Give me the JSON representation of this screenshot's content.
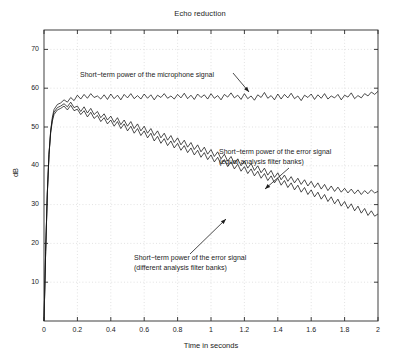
{
  "chart_data": {
    "type": "line",
    "title": "Echo reduction",
    "xlabel": "Time in seconds",
    "ylabel": "dB",
    "xlim": [
      0,
      2
    ],
    "ylim": [
      0,
      75
    ],
    "grid": true,
    "legend_position": "none",
    "xticks": [
      "0",
      "0.2",
      "0.4",
      "0.6",
      "0.8",
      "1",
      "1.2",
      "1.4",
      "1.6",
      "1.8",
      "2"
    ],
    "xtick_values": [
      0,
      0.2,
      0.4,
      0.6,
      0.8,
      1,
      1.2,
      1.4,
      1.6,
      1.8,
      2
    ],
    "yticks": [
      "10",
      "20",
      "30",
      "40",
      "50",
      "60",
      "70"
    ],
    "ytick_values": [
      10,
      20,
      30,
      40,
      50,
      60,
      70
    ],
    "x": [
      0.0,
      0.01,
      0.02,
      0.03,
      0.04,
      0.05,
      0.06,
      0.08,
      0.1,
      0.12,
      0.14,
      0.16,
      0.18,
      0.2,
      0.22,
      0.24,
      0.26,
      0.28,
      0.3,
      0.32,
      0.34,
      0.36,
      0.38,
      0.4,
      0.42,
      0.44,
      0.46,
      0.48,
      0.5,
      0.52,
      0.54,
      0.56,
      0.58,
      0.6,
      0.62,
      0.64,
      0.66,
      0.68,
      0.7,
      0.72,
      0.74,
      0.76,
      0.78,
      0.8,
      0.82,
      0.84,
      0.86,
      0.88,
      0.9,
      0.92,
      0.94,
      0.96,
      0.98,
      1.0,
      1.02,
      1.04,
      1.06,
      1.08,
      1.1,
      1.12,
      1.14,
      1.16,
      1.18,
      1.2,
      1.22,
      1.24,
      1.26,
      1.28,
      1.3,
      1.32,
      1.34,
      1.36,
      1.38,
      1.4,
      1.42,
      1.44,
      1.46,
      1.48,
      1.5,
      1.52,
      1.54,
      1.56,
      1.58,
      1.6,
      1.62,
      1.64,
      1.66,
      1.68,
      1.7,
      1.72,
      1.74,
      1.76,
      1.78,
      1.8,
      1.82,
      1.84,
      1.86,
      1.88,
      1.9,
      1.92,
      1.94,
      1.96,
      1.98,
      2.0
    ],
    "series": [
      {
        "name": "Short-term power of the microphone signal",
        "color": "#111111",
        "values": [
          0,
          18,
          33,
          43,
          49,
          52.5,
          54.5,
          55.8,
          56.2,
          57.0,
          56.4,
          57.6,
          56.8,
          58.2,
          57.2,
          58.4,
          57.4,
          58.6,
          57.6,
          58.0,
          57.2,
          58.3,
          57.1,
          58.5,
          57.3,
          58.2,
          57.0,
          58.4,
          57.5,
          58.6,
          57.3,
          58.1,
          57.2,
          58.5,
          57.4,
          58.3,
          57.0,
          58.2,
          57.6,
          58.6,
          57.4,
          58.0,
          57.2,
          58.4,
          57.5,
          58.7,
          57.3,
          58.2,
          57.1,
          58.5,
          57.6,
          58.3,
          57.2,
          58.6,
          57.4,
          58.1,
          57.0,
          58.4,
          57.7,
          58.8,
          57.5,
          58.2,
          57.1,
          58.6,
          57.3,
          58.0,
          56.9,
          58.3,
          57.6,
          58.9,
          57.4,
          58.1,
          57.0,
          58.5,
          57.2,
          58.4,
          57.5,
          58.7,
          57.3,
          58.0,
          56.8,
          58.2,
          57.6,
          58.5,
          57.1,
          58.3,
          57.4,
          58.6,
          57.2,
          58.0,
          57.5,
          58.4,
          57.0,
          58.2,
          57.7,
          58.8,
          57.3,
          58.1,
          57.5,
          58.6,
          58.0,
          59.0,
          58.4,
          59.2
        ]
      },
      {
        "name": "Short-term power of the error signal (equal analysis filter banks)",
        "color": "#111111",
        "values": [
          0,
          18,
          33,
          43,
          49,
          52.0,
          53.8,
          55.0,
          55.4,
          56.0,
          55.2,
          56.4,
          55.0,
          55.4,
          54.0,
          55.2,
          53.6,
          54.8,
          53.2,
          54.0,
          52.4,
          53.4,
          51.8,
          52.8,
          51.2,
          52.4,
          50.6,
          51.8,
          50.2,
          51.4,
          49.6,
          50.8,
          49.0,
          50.2,
          48.4,
          49.6,
          47.8,
          49.0,
          47.2,
          48.4,
          46.6,
          47.8,
          46.0,
          47.2,
          45.4,
          46.6,
          44.8,
          46.0,
          44.2,
          45.4,
          43.6,
          44.8,
          43.0,
          44.2,
          42.4,
          43.6,
          41.8,
          43.0,
          41.2,
          42.4,
          40.6,
          41.8,
          40.0,
          41.2,
          39.4,
          40.6,
          38.8,
          40.0,
          38.2,
          39.4,
          37.6,
          38.8,
          37.0,
          38.2,
          36.4,
          37.6,
          36.0,
          37.2,
          35.6,
          36.8,
          35.2,
          36.4,
          34.8,
          36.0,
          34.4,
          35.6,
          34.0,
          35.2,
          33.6,
          34.8,
          33.4,
          34.5,
          33.2,
          34.2,
          33.0,
          34.0,
          32.8,
          33.8,
          32.6,
          33.6,
          32.8,
          33.8,
          33.0,
          33.4
        ]
      },
      {
        "name": "Short-term power of the error signal (different analysis filter banks)",
        "color": "#111111",
        "values": [
          0,
          18,
          33,
          43,
          48.5,
          51.5,
          53.2,
          54.4,
          54.8,
          55.4,
          54.4,
          55.6,
          54.2,
          54.6,
          53.2,
          54.2,
          52.6,
          53.8,
          52.2,
          53.0,
          51.4,
          52.4,
          50.8,
          51.8,
          50.2,
          51.4,
          49.6,
          50.8,
          49.0,
          50.2,
          48.4,
          49.6,
          47.8,
          49.0,
          47.2,
          48.4,
          46.4,
          47.6,
          45.8,
          47.0,
          45.2,
          46.4,
          44.6,
          45.8,
          44.0,
          45.2,
          43.4,
          44.6,
          42.8,
          44.0,
          42.2,
          43.4,
          41.6,
          42.8,
          41.0,
          42.2,
          40.4,
          41.6,
          39.8,
          41.0,
          39.2,
          40.4,
          38.6,
          39.8,
          38.0,
          39.2,
          37.4,
          38.6,
          36.8,
          38.0,
          36.2,
          37.4,
          35.6,
          36.8,
          35.0,
          36.2,
          34.4,
          35.6,
          33.8,
          35.0,
          33.2,
          34.4,
          32.6,
          33.8,
          32.0,
          33.2,
          31.4,
          32.6,
          30.8,
          32.0,
          30.2,
          31.4,
          29.6,
          30.8,
          29.0,
          30.2,
          28.4,
          29.6,
          27.8,
          29.0,
          27.2,
          28.4,
          27.0,
          27.6
        ]
      }
    ],
    "annotations": [
      {
        "id": "annotation-microphone",
        "lines": [
          "Short−term power of the microphone signal"
        ],
        "text_x": 80,
        "text_y": 70,
        "arrow": {
          "x1": 233,
          "y1": 73,
          "x2": 249,
          "y2": 92
        }
      },
      {
        "id": "annotation-error-equal",
        "lines": [
          "Short−term power of the error signal",
          "(equal analysis filter banks)"
        ],
        "text_x": 219,
        "text_y": 147,
        "arrow": {
          "x1": 289,
          "y1": 168,
          "x2": 265,
          "y2": 189
        }
      },
      {
        "id": "annotation-error-different",
        "lines": [
          "Short−term power of the error signal",
          "(different analysis filter banks)"
        ],
        "text_x": 134,
        "text_y": 253,
        "arrow": {
          "x1": 190,
          "y1": 254,
          "x2": 226,
          "y2": 219
        }
      }
    ]
  }
}
